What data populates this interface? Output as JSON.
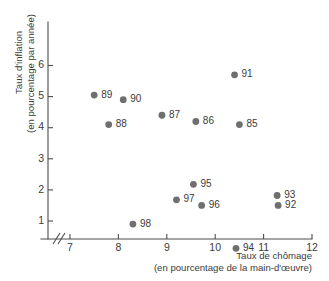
{
  "chart_data": {
    "type": "scatter",
    "title": "",
    "xlabel": "Taux de chômage",
    "xlabel_sub": "(en pourcentage de la main-d'œuvre)",
    "ylabel": "Taux d'inflation",
    "ylabel_sub": "(en pourcentage par année)",
    "xlim": [
      6.6,
      12.15
    ],
    "ylim": [
      0.0,
      6.55
    ],
    "xticks": [
      7,
      8,
      9,
      10,
      11,
      12
    ],
    "yticks": [
      1,
      2,
      3,
      4,
      5,
      6
    ],
    "xtick_labels": [
      "7",
      "8",
      "9",
      "10",
      "11",
      "12"
    ],
    "ytick_labels": [
      "1",
      "2",
      "3",
      "4",
      "5",
      "6"
    ],
    "grid": false,
    "legend": "none",
    "axis_break_x": true,
    "point_color": "#6f6f6f",
    "axis_color": "#4d4d4d",
    "text_color": "#3b3b3b",
    "points": [
      {
        "label": "85",
        "x": 10.5,
        "y": 4.1,
        "label_dx": 7,
        "label_dy": 0
      },
      {
        "label": "86",
        "x": 9.6,
        "y": 4.2,
        "label_dx": 7,
        "label_dy": 0
      },
      {
        "label": "87",
        "x": 8.9,
        "y": 4.4,
        "label_dx": 7,
        "label_dy": 0
      },
      {
        "label": "88",
        "x": 7.8,
        "y": 4.1,
        "label_dx": 7,
        "label_dy": 0
      },
      {
        "label": "89",
        "x": 7.5,
        "y": 5.05,
        "label_dx": 7,
        "label_dy": 0
      },
      {
        "label": "90",
        "x": 8.1,
        "y": 4.9,
        "label_dx": 7,
        "label_dy": 0
      },
      {
        "label": "91",
        "x": 10.4,
        "y": 5.7,
        "label_dx": 7,
        "label_dy": 0
      },
      {
        "label": "92",
        "x": 11.3,
        "y": 1.5,
        "label_dx": 7,
        "label_dy": 0
      },
      {
        "label": "93",
        "x": 11.28,
        "y": 1.82,
        "label_dx": 7,
        "label_dy": 0
      },
      {
        "label": "94",
        "x": 10.43,
        "y": 0.12,
        "label_dx": 7,
        "label_dy": 0
      },
      {
        "label": "95",
        "x": 9.55,
        "y": 2.18,
        "label_dx": 7,
        "label_dy": 0
      },
      {
        "label": "96",
        "x": 9.72,
        "y": 1.5,
        "label_dx": 7,
        "label_dy": 0
      },
      {
        "label": "97",
        "x": 9.2,
        "y": 1.68,
        "label_dx": 7,
        "label_dy": 0
      },
      {
        "label": "98",
        "x": 8.3,
        "y": 0.9,
        "label_dx": 7,
        "label_dy": 0
      }
    ]
  }
}
